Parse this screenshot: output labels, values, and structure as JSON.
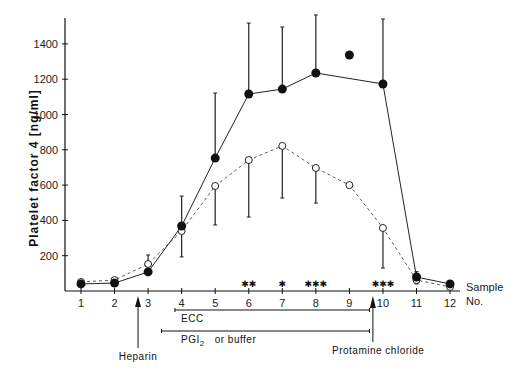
{
  "chart_data": {
    "type": "line",
    "title": "",
    "xlabel": "Sample No.",
    "ylabel": "Platelet factor 4 [ng/ml]",
    "ylim": [
      0,
      1500
    ],
    "yticks": [
      200,
      400,
      600,
      800,
      1000,
      1200,
      1400
    ],
    "x": [
      1,
      2,
      3,
      4,
      5,
      6,
      7,
      8,
      9,
      10,
      11,
      12
    ],
    "grid": false,
    "series": [
      {
        "name": "PGI2 (filled circles)",
        "marker": "filled-circle",
        "line": "solid",
        "values": [
          40,
          45,
          108,
          368,
          753,
          1116,
          1144,
          1235,
          1337,
          1173,
          79,
          40
        ],
        "error_upper": [
          null,
          null,
          null,
          538,
          1122,
          1518,
          1496,
          1564,
          null,
          1541,
          110,
          null
        ],
        "connected": [
          true,
          true,
          true,
          true,
          true,
          true,
          true,
          true,
          false,
          true,
          true,
          true
        ]
      },
      {
        "name": "buffer (open circles)",
        "marker": "open-circle",
        "line": "dashed",
        "values": [
          51,
          62,
          153,
          340,
          595,
          742,
          822,
          697,
          600,
          357,
          62,
          23
        ],
        "error_lower": [
          null,
          null,
          null,
          193,
          374,
          419,
          527,
          498,
          null,
          130,
          40,
          null
        ],
        "error_upper": [
          null,
          75,
          204,
          null,
          null,
          null,
          null,
          null,
          null,
          null,
          null,
          null
        ]
      }
    ],
    "significance_markers": [
      {
        "x": 6,
        "label": "**"
      },
      {
        "x": 7,
        "label": "*"
      },
      {
        "x": 8,
        "label": "***"
      },
      {
        "x": 10,
        "label": "***"
      }
    ],
    "annotations": {
      "heparin": {
        "label": "Heparin",
        "x": 2.7
      },
      "protamine": {
        "label": "Protamine chloride",
        "x": 9.7
      },
      "ecc": {
        "label": "ECC",
        "from": 3.8,
        "to": 9.6
      },
      "pgi": {
        "label_main": "PGI",
        "label_sub": "2",
        "label_rest": "or    buffer",
        "from": 3.4,
        "to": 9.6
      }
    },
    "axis_labels": {
      "x_line1": "Sample",
      "x_line2": "No."
    }
  }
}
